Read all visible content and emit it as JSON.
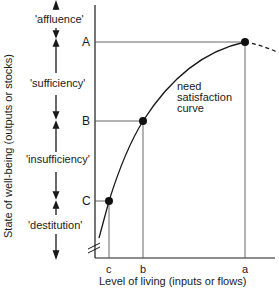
{
  "diagram": {
    "y_axis_label": "State of well-being (outputs or stocks)",
    "x_axis_label": "Level of living (inputs or flows)",
    "zones": [
      {
        "label": "'affluence'"
      },
      {
        "label": "'sufficiency'"
      },
      {
        "label": "'insufficiency'"
      },
      {
        "label": "'destitution'"
      }
    ],
    "y_levels": [
      {
        "label": "A"
      },
      {
        "label": "B"
      },
      {
        "label": "C"
      }
    ],
    "x_levels": [
      {
        "label": "c"
      },
      {
        "label": "b"
      },
      {
        "label": "a"
      }
    ],
    "curve_label": [
      "need",
      "satisfaction",
      "curve"
    ],
    "colors": {
      "ink": "#1a1a1a",
      "guide": "#555555"
    }
  }
}
